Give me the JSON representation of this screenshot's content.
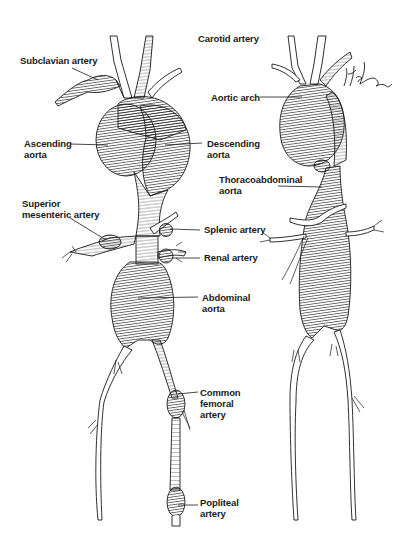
{
  "figure": {
    "views": [
      "anterior",
      "lateral"
    ],
    "colors": {
      "ink": "#1a1a1a",
      "background": "#ffffff"
    },
    "signature": "Hank Iorio"
  },
  "labels": {
    "carotid": {
      "lines": [
        "Carotid artery"
      ]
    },
    "subclavian": {
      "lines": [
        "Subclavian artery"
      ]
    },
    "ascending": {
      "lines": [
        "Ascending",
        "aorta"
      ]
    },
    "descending": {
      "lines": [
        "Descending",
        "aorta"
      ]
    },
    "aortic_arch": {
      "lines": [
        "Aortic arch"
      ]
    },
    "thoracoabdominal": {
      "lines": [
        "Thoracoabdominal",
        "aorta"
      ]
    },
    "superior_mesenteric": {
      "lines": [
        "Superior",
        "mesenteric artery"
      ]
    },
    "splenic": {
      "lines": [
        "Splenic artery"
      ]
    },
    "renal": {
      "lines": [
        "Renal artery"
      ]
    },
    "abdominal": {
      "lines": [
        "Abdominal",
        "aorta"
      ]
    },
    "common_femoral": {
      "lines": [
        "Common",
        "femoral",
        "artery"
      ]
    },
    "popliteal": {
      "lines": [
        "Popliteal",
        "artery"
      ]
    }
  }
}
